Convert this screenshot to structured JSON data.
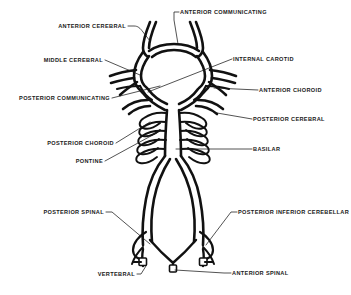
{
  "figure": {
    "style": {
      "background": "#ffffff",
      "ink": "#111111",
      "leader": "#1a1a1a"
    },
    "labels": [
      {
        "id": "anterior-cerebral",
        "text": "ANTERIOR CEREBRAL",
        "align": "end",
        "x": 126,
        "y": 28
      },
      {
        "id": "anterior-communicating",
        "text": "ANTERIOR COMMUNICATING",
        "align": "start",
        "x": 180,
        "y": 14
      },
      {
        "id": "middle-cerebral",
        "text": "MIDDLE CEREBRAL",
        "align": "end",
        "x": 103,
        "y": 62
      },
      {
        "id": "internal-carotid",
        "text": "INTERNAL CAROTID",
        "align": "start",
        "x": 233,
        "y": 61
      },
      {
        "id": "posterior-communicating",
        "text": "POSTERIOR COMMUNICATING",
        "align": "end",
        "x": 110,
        "y": 100
      },
      {
        "id": "anterior-choroid",
        "text": "ANTERIOR CHOROID",
        "align": "start",
        "x": 259,
        "y": 92
      },
      {
        "id": "posterior-cerebral",
        "text": "POSTERIOR CEREBRAL",
        "align": "start",
        "x": 253,
        "y": 121
      },
      {
        "id": "posterior-choroid",
        "text": "POSTERIOR CHOROID",
        "align": "end",
        "x": 114,
        "y": 145
      },
      {
        "id": "basilar",
        "text": "BASILAR",
        "align": "start",
        "x": 253,
        "y": 151
      },
      {
        "id": "pontine",
        "text": "PONTINE",
        "align": "end",
        "x": 103,
        "y": 163
      },
      {
        "id": "posterior-spinal",
        "text": "POSTERIOR SPINAL",
        "align": "end",
        "x": 104,
        "y": 214
      },
      {
        "id": "posterior-inferior-cerebellar",
        "text": "POSTERIOR INFERIOR CEREBELLAR",
        "align": "start",
        "x": 238,
        "y": 214
      },
      {
        "id": "vertebral",
        "text": "VERTEBRAL",
        "align": "end",
        "x": 135,
        "y": 276
      },
      {
        "id": "anterior-spinal",
        "text": "ANTERIOR SPINAL",
        "align": "start",
        "x": 232,
        "y": 275
      }
    ],
    "structures": [
      "anterior-cerebral-arteries",
      "anterior-communicating-artery",
      "middle-cerebral-arteries",
      "internal-carotid-arteries",
      "posterior-communicating-arteries",
      "anterior-choroidal-artery",
      "posterior-cerebral-arteries",
      "posterior-choroidal-arteries",
      "basilar-artery",
      "pontine-arteries",
      "posterior-spinal-arteries",
      "posterior-inferior-cerebellar-arteries",
      "vertebral-arteries",
      "anterior-spinal-artery"
    ]
  }
}
